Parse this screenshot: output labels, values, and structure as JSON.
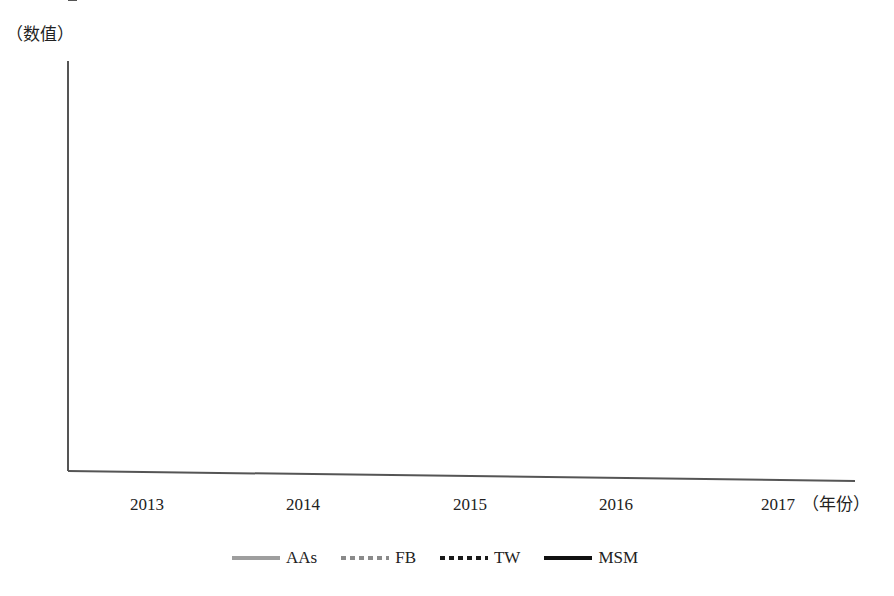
{
  "chart_data": {
    "type": "line",
    "title": "",
    "ylabel": "（数值）",
    "xlabel": "（年份）",
    "categories": [
      "2013",
      "2014",
      "2015",
      "2016",
      "2017"
    ],
    "ylim": [
      0,
      20
    ],
    "yticks": [
      0,
      2,
      4,
      6,
      8,
      10,
      12,
      14,
      16,
      18,
      20
    ],
    "grid": false,
    "legend_position": "bottom",
    "series": [
      {
        "name": "AAs",
        "values": [
          12.7,
          8.1,
          17.8,
          4.8,
          7.0
        ],
        "color": "#9e9e9e",
        "style": "solid",
        "width": 4
      },
      {
        "name": "FB",
        "values": [
          0.9,
          0.8,
          1.0,
          1.0,
          0.5
        ],
        "color": "#8a8a8a",
        "style": "dotted",
        "width": 4
      },
      {
        "name": "TW",
        "values": [
          5.3,
          7.8,
          12.0,
          3.5,
          6.1
        ],
        "color": "#1a1a1a",
        "style": "dotted",
        "width": 4
      },
      {
        "name": "MSM",
        "values": [
          3.6,
          0.8,
          4.4,
          7.6,
          1.8
        ],
        "color": "#111111",
        "style": "solid",
        "width": 4
      }
    ]
  },
  "labels": {
    "ylabel": "（数值）",
    "xlabel_suffix": "（年份）"
  }
}
